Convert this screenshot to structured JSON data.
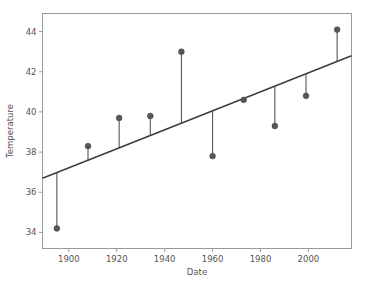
{
  "chart_data": {
    "type": "scatter",
    "title": "",
    "xlabel": "Date",
    "ylabel": "Temperature",
    "xlim": [
      1889,
      2018
    ],
    "ylim": [
      33.2,
      44.9
    ],
    "xticks": [
      1900,
      1920,
      1940,
      1960,
      1980,
      2000
    ],
    "xtick_labels": [
      "1900",
      "1920",
      "1940",
      "1960",
      "1980",
      "2000"
    ],
    "yticks": [
      34,
      36,
      38,
      40,
      42,
      44
    ],
    "ytick_labels": [
      "34",
      "36",
      "38",
      "40",
      "42",
      "44"
    ],
    "grid": false,
    "legend": null,
    "series": [
      {
        "name": "Temperature observations",
        "marker": "circle",
        "color": "#55555a",
        "stems_to_trend": true,
        "x": [
          1895,
          1908,
          1921,
          1934,
          1947,
          1960,
          1973,
          1986,
          1999,
          2012
        ],
        "y": [
          34.2,
          38.3,
          39.7,
          39.8,
          43.0,
          37.8,
          40.6,
          39.3,
          40.8,
          44.1
        ]
      },
      {
        "name": "Linear trend",
        "type": "line",
        "color": "#3c3c42",
        "x": [
          1889,
          2018
        ],
        "y": [
          36.7,
          42.8
        ]
      }
    ],
    "annotations": []
  },
  "axes": {
    "x_title": "Date",
    "y_title": "Temperature"
  },
  "colors": {
    "marker": "#55555a",
    "trend": "#3c3c42",
    "spine": "#9a9a9a",
    "text": "#555555",
    "background": "#ffffff"
  }
}
